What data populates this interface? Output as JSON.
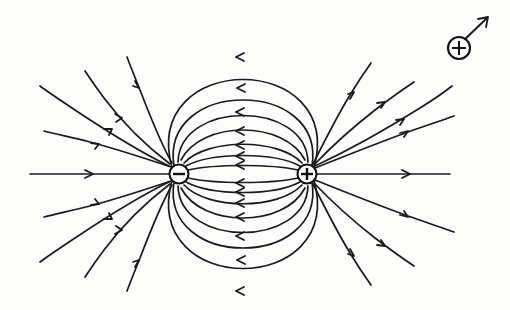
{
  "figure": {
    "type": "physics-field-diagram",
    "background_color": "#fdfdfc",
    "line_color": "#1a1a1a",
    "width": 510,
    "height": 310
  },
  "charges": [
    {
      "id": "negative-charge",
      "label": "−",
      "sign": "negative",
      "cx": 179,
      "cy": 174,
      "r": 9.5,
      "name": "negative-charge-symbol"
    },
    {
      "id": "positive-charge",
      "label": "+",
      "sign": "positive",
      "cx": 307,
      "cy": 174,
      "r": 9.5,
      "name": "positive-charge-symbol"
    }
  ],
  "test_charge": {
    "id": "test-charge",
    "label": "+",
    "sign": "positive",
    "cx": 459,
    "cy": 48,
    "r": 11,
    "force_vector": {
      "from_x": 462,
      "from_y": 42,
      "to_x": 489,
      "to_y": 16,
      "direction": "up-right"
    }
  },
  "chart_data": {
    "type": "diagram",
    "dipole_axis_y": 174,
    "negative_charge_x": 179,
    "positive_charge_x": 307,
    "loop_arc_count": 16,
    "outer_line_count": 16,
    "arrow_direction": "positive-to-negative",
    "xlabel": "",
    "ylabel": "",
    "legend": []
  },
  "geometry": {
    "loops": [
      {
        "h": 6,
        "arrow_t": 0.5
      },
      {
        "h": 14,
        "arrow_t": 0.5
      },
      {
        "h": 24,
        "arrow_t": 0.5
      },
      {
        "h": 36,
        "arrow_t": 0.5
      },
      {
        "h": 50,
        "arrow_t": 0.5
      },
      {
        "h": 66,
        "arrow_t": 0.5
      },
      {
        "h": 86,
        "arrow_t": 0.5
      },
      {
        "h": 112,
        "arrow_t": 0.5
      },
      {
        "h": 150,
        "arrow_t": 0.5
      }
    ],
    "axis_line": {
      "x1": 30,
      "x2": 450,
      "y": 174
    },
    "outer_angles_negative": [
      200,
      216,
      233,
      250,
      268,
      110,
      127,
      145,
      162,
      180
    ],
    "outer_angles_positive": [
      340,
      324,
      307,
      290,
      272,
      70,
      53,
      35,
      18,
      0
    ]
  }
}
